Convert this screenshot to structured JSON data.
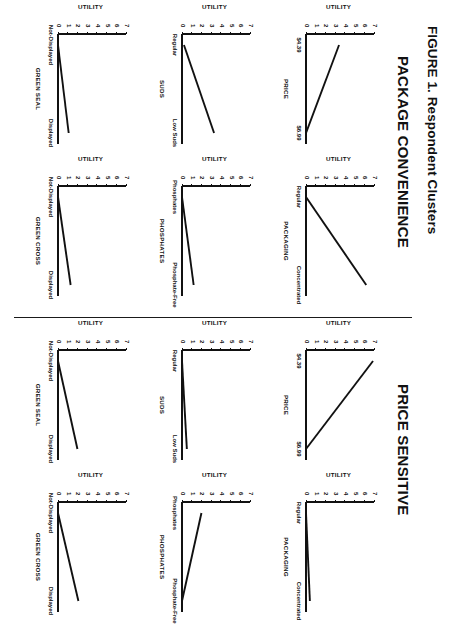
{
  "figure": {
    "caption": "FIGURE 1. Respondent Clusters"
  },
  "panels": [
    {
      "id": "package-convenience",
      "title": "PACKAGE CONVENIENCE"
    },
    {
      "id": "price-sensitive",
      "title": "PRICE SENSITIVE"
    }
  ],
  "axis": {
    "y_title": "UTILITY",
    "y_ticks": [
      "7",
      "6",
      "5",
      "4",
      "3",
      "2",
      "1",
      "0"
    ],
    "y_min": 0,
    "y_max": 7
  },
  "chart_data": [
    {
      "type": "line",
      "panel": "PACKAGE CONVENIENCE",
      "title": "PRICE",
      "xlabel": "PRICE",
      "ylabel": "UTILITY",
      "categories": [
        "$4.39",
        "$6.99"
      ],
      "values": [
        3.4,
        0.0
      ],
      "ylim": [
        0,
        7
      ],
      "yticks": [
        0,
        1,
        2,
        3,
        4,
        5,
        6,
        7
      ],
      "grid": false,
      "legend": "none"
    },
    {
      "type": "line",
      "panel": "PACKAGE CONVENIENCE",
      "title": "PACKAGING",
      "xlabel": "PACKAGING",
      "ylabel": "UTILITY",
      "categories": [
        "Regular",
        "Concentrated"
      ],
      "values": [
        0.0,
        6.2
      ],
      "ylim": [
        0,
        7
      ],
      "yticks": [
        0,
        1,
        2,
        3,
        4,
        5,
        6,
        7
      ],
      "grid": false,
      "legend": "none"
    },
    {
      "type": "line",
      "panel": "PACKAGE CONVENIENCE",
      "title": "SUDS",
      "xlabel": "SUDS",
      "ylabel": "UTILITY",
      "categories": [
        "Regular",
        "Low Suds"
      ],
      "values": [
        0.2,
        3.3
      ],
      "ylim": [
        0,
        7
      ],
      "yticks": [
        0,
        1,
        2,
        3,
        4,
        5,
        6,
        7
      ],
      "grid": false,
      "legend": "none"
    },
    {
      "type": "line",
      "panel": "PACKAGE CONVENIENCE",
      "title": "PHOSPHATES",
      "xlabel": "PHOSPHATES",
      "ylabel": "UTILITY",
      "categories": [
        "Phosphates",
        "Phosphate-Free"
      ],
      "values": [
        0.0,
        1.2
      ],
      "ylim": [
        0,
        7
      ],
      "yticks": [
        0,
        1,
        2,
        3,
        4,
        5,
        6,
        7
      ],
      "grid": false,
      "legend": "none"
    },
    {
      "type": "line",
      "panel": "PACKAGE CONVENIENCE",
      "title": "GREEN SEAL",
      "xlabel": "GREEN SEAL",
      "ylabel": "UTILITY",
      "categories": [
        "Not-Displayed",
        "Displayed"
      ],
      "values": [
        0.0,
        1.1
      ],
      "ylim": [
        0,
        7
      ],
      "yticks": [
        0,
        1,
        2,
        3,
        4,
        5,
        6,
        7
      ],
      "grid": false,
      "legend": "none"
    },
    {
      "type": "line",
      "panel": "PACKAGE CONVENIENCE",
      "title": "GREEN CROSS",
      "xlabel": "GREEN CROSS",
      "ylabel": "UTILITY",
      "categories": [
        "Not-Displayed",
        "Displayed"
      ],
      "values": [
        0.0,
        1.3
      ],
      "ylim": [
        0,
        7
      ],
      "yticks": [
        0,
        1,
        2,
        3,
        4,
        5,
        6,
        7
      ],
      "grid": false,
      "legend": "none"
    },
    {
      "type": "line",
      "panel": "PRICE SENSITIVE",
      "title": "PRICE",
      "xlabel": "PRICE",
      "ylabel": "UTILITY",
      "categories": [
        "$4.39",
        "$6.99"
      ],
      "values": [
        6.9,
        0.0
      ],
      "ylim": [
        0,
        7
      ],
      "yticks": [
        0,
        1,
        2,
        3,
        4,
        5,
        6,
        7
      ],
      "grid": false,
      "legend": "none"
    },
    {
      "type": "line",
      "panel": "PRICE SENSITIVE",
      "title": "PACKAGING",
      "xlabel": "PACKAGING",
      "ylabel": "UTILITY",
      "categories": [
        "Regular",
        "Concentrated"
      ],
      "values": [
        0.0,
        0.4
      ],
      "ylim": [
        0,
        7
      ],
      "yticks": [
        0,
        1,
        2,
        3,
        4,
        5,
        6,
        7
      ],
      "grid": false,
      "legend": "none"
    },
    {
      "type": "line",
      "panel": "PRICE SENSITIVE",
      "title": "SUDS",
      "xlabel": "SUDS",
      "ylabel": "UTILITY",
      "categories": [
        "Regular",
        "Low Suds"
      ],
      "values": [
        0.0,
        0.5
      ],
      "ylim": [
        0,
        7
      ],
      "yticks": [
        0,
        1,
        2,
        3,
        4,
        5,
        6,
        7
      ],
      "grid": false,
      "legend": "none"
    },
    {
      "type": "line",
      "panel": "PRICE SENSITIVE",
      "title": "PHOSPHATES",
      "xlabel": "PHOSPHATES",
      "ylabel": "UTILITY",
      "categories": [
        "Phosphates",
        "Phosphate-Free"
      ],
      "values": [
        2.0,
        0.0
      ],
      "ylim": [
        0,
        7
      ],
      "yticks": [
        0,
        1,
        2,
        3,
        4,
        5,
        6,
        7
      ],
      "grid": false,
      "legend": "none"
    },
    {
      "type": "line",
      "panel": "PRICE SENSITIVE",
      "title": "GREEN SEAL",
      "xlabel": "GREEN SEAL",
      "ylabel": "UTILITY",
      "categories": [
        "Not-Displayed",
        "Displayed"
      ],
      "values": [
        0.0,
        2.0
      ],
      "ylim": [
        0,
        7
      ],
      "yticks": [
        0,
        1,
        2,
        3,
        4,
        5,
        6,
        7
      ],
      "grid": false,
      "legend": "none"
    },
    {
      "type": "line",
      "panel": "PRICE SENSITIVE",
      "title": "GREEN CROSS",
      "xlabel": "GREEN CROSS",
      "ylabel": "UTILITY",
      "categories": [
        "Not-Displayed",
        "Displayed"
      ],
      "values": [
        0.0,
        2.1
      ],
      "ylim": [
        0,
        7
      ],
      "yticks": [
        0,
        1,
        2,
        3,
        4,
        5,
        6,
        7
      ],
      "grid": false,
      "legend": "none"
    }
  ]
}
